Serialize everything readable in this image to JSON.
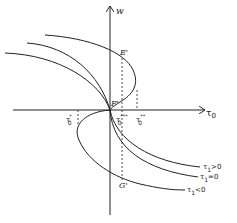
{
  "diagram": {
    "axes": {
      "y_label": "w",
      "x_label": "τ",
      "x_label_sub": "0"
    },
    "points": {
      "E": "E'",
      "F": "F'",
      "G": "G'"
    },
    "ticks": [
      {
        "base": "τ",
        "sub": "0",
        "sup": "*"
      },
      {
        "base": "τ",
        "sub": "0",
        "sup": "***"
      },
      {
        "base": "τ",
        "sub": "0",
        "sup": "**"
      }
    ],
    "curves": [
      {
        "label": "τ",
        "sub": "1",
        "rel": ">0"
      },
      {
        "label": "τ",
        "sub": "1",
        "rel": "=0"
      },
      {
        "label": "τ",
        "sub": "1",
        "rel": "<0"
      }
    ]
  }
}
